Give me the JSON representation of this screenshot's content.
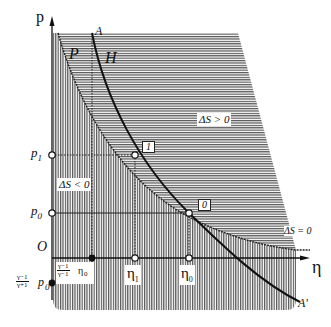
{
  "axes": {
    "y_label": "p",
    "x_label": "η",
    "origin_label": "O"
  },
  "curves": {
    "p_curve_label": "P",
    "h_curve_label": "H",
    "h_start_label": "A",
    "h_end_label": "A'"
  },
  "regions": {
    "positive": "ΔS > 0",
    "negative": "ΔS < 0",
    "zero": "ΔS = 0"
  },
  "points": {
    "p1": "p",
    "p1_sub": "1",
    "p0": "p",
    "p0_sub": "0",
    "state1": "1",
    "state0": "0",
    "eta1": "η",
    "eta1_sub": "1",
    "eta0": "η",
    "eta0_sub": "0",
    "eta_min_num": "γ−1",
    "eta_min_den": "γ−1",
    "eta_min_sym": "η",
    "eta_min_sub": "0",
    "p_min_num": "γ−1",
    "p_min_den": "γ+1",
    "p_min_sym": "p",
    "p_min_sub": "0"
  },
  "colors": {
    "ink": "#111111",
    "hatch": "#555555",
    "background": "#ffffff"
  }
}
